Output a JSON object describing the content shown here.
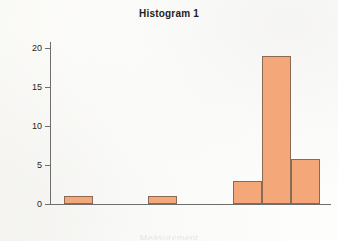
{
  "chart_data": {
    "type": "bar",
    "title": "Histogram 1",
    "xlabel": "Measurement",
    "ylabel": "Frequency",
    "grid": false,
    "legend": false,
    "ylim": [
      0,
      21
    ],
    "yticks": [
      0,
      5,
      10,
      15,
      20
    ],
    "ytick_labels": [
      "0",
      "5",
      "10",
      "15",
      "20"
    ],
    "xticks": [],
    "xtick_labels": [],
    "bin_count": 9,
    "bars": [
      {
        "bin_index": 0,
        "value": 1.0,
        "left_frac": 0.05,
        "width_frac": 0.104
      },
      {
        "bin_index": 1,
        "value": 0.0,
        "left_frac": 0.154,
        "width_frac": 0.104
      },
      {
        "bin_index": 2,
        "value": 0.0,
        "left_frac": 0.258,
        "width_frac": 0.104
      },
      {
        "bin_index": 3,
        "value": 1.0,
        "left_frac": 0.349,
        "width_frac": 0.104
      },
      {
        "bin_index": 4,
        "value": 0.0,
        "left_frac": 0.453,
        "width_frac": 0.104
      },
      {
        "bin_index": 5,
        "value": 0.0,
        "left_frac": 0.557,
        "width_frac": 0.104
      },
      {
        "bin_index": 6,
        "value": 2.9,
        "left_frac": 0.651,
        "width_frac": 0.104
      },
      {
        "bin_index": 7,
        "value": 19.0,
        "left_frac": 0.755,
        "width_frac": 0.104
      },
      {
        "bin_index": 8,
        "value": 5.8,
        "left_frac": 0.858,
        "width_frac": 0.104
      }
    ],
    "values": [
      1,
      0,
      0,
      1,
      0,
      0,
      2.9,
      19,
      5.8
    ],
    "categories": [
      "1",
      "2",
      "3",
      "4",
      "5",
      "6",
      "7",
      "8",
      "9"
    ],
    "colors": {
      "bar_fill": "#f4a87a",
      "bar_border": "#8a6a55",
      "axis": "#6e6e6e",
      "text": "#1d1d1d",
      "background": "#fdfdfc"
    }
  }
}
